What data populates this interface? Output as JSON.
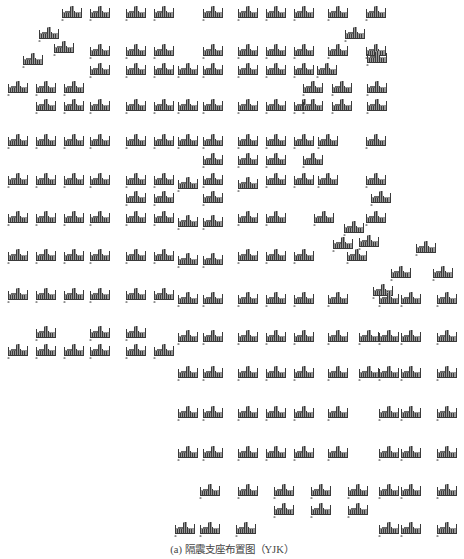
{
  "figure": {
    "caption": "(a) 隔震支座布置图（YJK）",
    "colors": {
      "bar_dark": "#3a3a3a",
      "bar_fill": "#9a9a9a",
      "marker": "#8c8c8c",
      "background": "#ffffff"
    },
    "glyph": {
      "name": "isolation-bearing-symbol",
      "width": 22,
      "height": 14
    }
  },
  "bearings": [
    [
      61,
      5
    ],
    [
      89,
      5
    ],
    [
      125,
      5
    ],
    [
      153,
      5
    ],
    [
      202,
      5
    ],
    [
      237,
      5
    ],
    [
      265,
      5
    ],
    [
      293,
      5
    ],
    [
      327,
      5
    ],
    [
      365,
      5
    ],
    [
      38,
      26
    ],
    [
      53,
      40
    ],
    [
      344,
      26
    ],
    [
      89,
      43
    ],
    [
      125,
      43
    ],
    [
      153,
      43
    ],
    [
      202,
      43
    ],
    [
      237,
      43
    ],
    [
      265,
      43
    ],
    [
      293,
      43
    ],
    [
      327,
      43
    ],
    [
      365,
      43
    ],
    [
      366,
      50
    ],
    [
      22,
      52
    ],
    [
      89,
      62
    ],
    [
      125,
      62
    ],
    [
      153,
      62
    ],
    [
      177,
      62
    ],
    [
      202,
      62
    ],
    [
      237,
      62
    ],
    [
      265,
      62
    ],
    [
      293,
      62
    ],
    [
      316,
      62
    ],
    [
      7,
      80
    ],
    [
      35,
      80
    ],
    [
      63,
      80
    ],
    [
      302,
      80
    ],
    [
      331,
      80
    ],
    [
      366,
      80
    ],
    [
      35,
      98
    ],
    [
      63,
      98
    ],
    [
      89,
      98
    ],
    [
      125,
      98
    ],
    [
      153,
      98
    ],
    [
      177,
      98
    ],
    [
      202,
      98
    ],
    [
      237,
      98
    ],
    [
      265,
      98
    ],
    [
      293,
      98
    ],
    [
      302,
      98
    ],
    [
      331,
      98
    ],
    [
      366,
      98
    ],
    [
      7,
      133
    ],
    [
      35,
      133
    ],
    [
      63,
      133
    ],
    [
      89,
      133
    ],
    [
      125,
      133
    ],
    [
      153,
      133
    ],
    [
      177,
      133
    ],
    [
      202,
      133
    ],
    [
      237,
      133
    ],
    [
      265,
      133
    ],
    [
      293,
      133
    ],
    [
      317,
      133
    ],
    [
      365,
      133
    ],
    [
      202,
      152
    ],
    [
      237,
      152
    ],
    [
      265,
      152
    ],
    [
      302,
      152
    ],
    [
      7,
      172
    ],
    [
      35,
      172
    ],
    [
      63,
      172
    ],
    [
      89,
      172
    ],
    [
      125,
      172
    ],
    [
      153,
      172
    ],
    [
      177,
      176
    ],
    [
      202,
      172
    ],
    [
      237,
      176
    ],
    [
      265,
      172
    ],
    [
      293,
      172
    ],
    [
      317,
      172
    ],
    [
      365,
      172
    ],
    [
      125,
      190
    ],
    [
      153,
      190
    ],
    [
      202,
      190
    ],
    [
      370,
      190
    ],
    [
      7,
      210
    ],
    [
      35,
      210
    ],
    [
      63,
      210
    ],
    [
      89,
      210
    ],
    [
      125,
      210
    ],
    [
      153,
      210
    ],
    [
      177,
      214
    ],
    [
      202,
      214
    ],
    [
      237,
      210
    ],
    [
      265,
      210
    ],
    [
      313,
      210
    ],
    [
      365,
      210
    ],
    [
      343,
      220
    ],
    [
      332,
      236
    ],
    [
      358,
      234
    ],
    [
      7,
      248
    ],
    [
      35,
      248
    ],
    [
      63,
      248
    ],
    [
      89,
      248
    ],
    [
      125,
      248
    ],
    [
      153,
      248
    ],
    [
      177,
      252
    ],
    [
      202,
      252
    ],
    [
      237,
      248
    ],
    [
      265,
      248
    ],
    [
      293,
      248
    ],
    [
      346,
      248
    ],
    [
      415,
      240
    ],
    [
      390,
      265
    ],
    [
      432,
      265
    ],
    [
      7,
      287
    ],
    [
      35,
      287
    ],
    [
      63,
      287
    ],
    [
      89,
      287
    ],
    [
      125,
      287
    ],
    [
      153,
      287
    ],
    [
      177,
      291
    ],
    [
      202,
      291
    ],
    [
      237,
      291
    ],
    [
      265,
      291
    ],
    [
      293,
      291
    ],
    [
      327,
      291
    ],
    [
      372,
      283
    ],
    [
      378,
      291
    ],
    [
      400,
      291
    ],
    [
      436,
      291
    ],
    [
      35,
      325
    ],
    [
      89,
      325
    ],
    [
      125,
      325
    ],
    [
      7,
      343
    ],
    [
      35,
      343
    ],
    [
      63,
      343
    ],
    [
      89,
      343
    ],
    [
      125,
      343
    ],
    [
      153,
      343
    ],
    [
      177,
      329
    ],
    [
      202,
      329
    ],
    [
      237,
      329
    ],
    [
      265,
      329
    ],
    [
      293,
      329
    ],
    [
      327,
      329
    ],
    [
      358,
      329
    ],
    [
      378,
      329
    ],
    [
      400,
      329
    ],
    [
      436,
      329
    ],
    [
      177,
      365
    ],
    [
      202,
      365
    ],
    [
      237,
      365
    ],
    [
      265,
      365
    ],
    [
      293,
      365
    ],
    [
      327,
      365
    ],
    [
      358,
      365
    ],
    [
      378,
      365
    ],
    [
      400,
      365
    ],
    [
      436,
      365
    ],
    [
      177,
      405
    ],
    [
      202,
      405
    ],
    [
      237,
      405
    ],
    [
      265,
      405
    ],
    [
      293,
      405
    ],
    [
      327,
      405
    ],
    [
      378,
      405
    ],
    [
      400,
      405
    ],
    [
      436,
      405
    ],
    [
      177,
      445
    ],
    [
      202,
      445
    ],
    [
      237,
      445
    ],
    [
      265,
      445
    ],
    [
      293,
      445
    ],
    [
      327,
      445
    ],
    [
      378,
      445
    ],
    [
      400,
      445
    ],
    [
      436,
      445
    ],
    [
      199,
      483
    ],
    [
      237,
      483
    ],
    [
      273,
      483
    ],
    [
      310,
      483
    ],
    [
      347,
      483
    ],
    [
      378,
      483
    ],
    [
      400,
      483
    ],
    [
      436,
      483
    ],
    [
      273,
      502
    ],
    [
      310,
      502
    ],
    [
      347,
      502
    ],
    [
      174,
      521
    ],
    [
      199,
      521
    ],
    [
      235,
      521
    ],
    [
      378,
      521
    ],
    [
      400,
      521
    ],
    [
      436,
      521
    ]
  ]
}
